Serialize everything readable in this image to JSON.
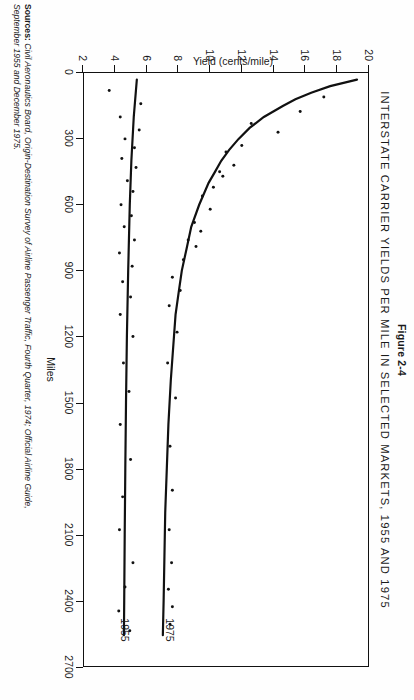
{
  "figure": {
    "number": "Figure 2-4",
    "title": "INTERSTATE CARRIER YIELDS PER MILE IN SELECTED MARKETS, 1955 AND 1975",
    "sources_label": "Sources:",
    "sources_line1": "Civil Aeronautics Board, Origin-Destination Survey of Airline Passenger Traffic, Fourth Quarter, 1974; Official Airline Guide,",
    "sources_line2": "September 1955 and December 1975."
  },
  "chart_data": {
    "type": "scatter",
    "title": "INTERSTATE CARRIER YIELDS PER MILE IN SELECTED MARKETS, 1955 AND 1975",
    "xlabel": "Miles",
    "ylabel": "Yield (cents/mile)",
    "xlim": [
      0,
      2700
    ],
    "ylim": [
      2,
      20
    ],
    "grid": false,
    "legend": "inline-curve-labels",
    "xticks": [
      0,
      300,
      600,
      900,
      1200,
      1500,
      1800,
      2100,
      2400,
      2700
    ],
    "xtick_labels": [
      "0",
      "300",
      "600",
      "900",
      "1200",
      "1500",
      "1800",
      "2100",
      "2400",
      "2700"
    ],
    "yticks": [
      2,
      4,
      6,
      8,
      10,
      12,
      14,
      16,
      18,
      20
    ],
    "ytick_labels": [
      "2",
      "4",
      "6",
      "8",
      "10",
      "12",
      "14",
      "16",
      "18",
      "20"
    ],
    "series": [
      {
        "name": "1975",
        "label": "1975",
        "label_x": 2520,
        "label_y": 7.4,
        "curve": [
          [
            30,
            19.3
          ],
          [
            60,
            17.6
          ],
          [
            90,
            16.4
          ],
          [
            120,
            15.4
          ],
          [
            150,
            14.6
          ],
          [
            200,
            13.4
          ],
          [
            250,
            12.5
          ],
          [
            300,
            11.8
          ],
          [
            350,
            11.2
          ],
          [
            400,
            10.7
          ],
          [
            450,
            10.3
          ],
          [
            500,
            9.9
          ],
          [
            600,
            9.3
          ],
          [
            700,
            8.8
          ],
          [
            800,
            8.5
          ],
          [
            900,
            8.2
          ],
          [
            1000,
            8.0
          ],
          [
            1100,
            7.8
          ],
          [
            1200,
            7.7
          ],
          [
            1400,
            7.5
          ],
          [
            1600,
            7.35
          ],
          [
            1800,
            7.25
          ],
          [
            2000,
            7.15
          ],
          [
            2200,
            7.1
          ],
          [
            2400,
            7.05
          ],
          [
            2560,
            7.0
          ]
        ],
        "points": [
          [
            110,
            17.2
          ],
          [
            175,
            15.7
          ],
          [
            230,
            12.6
          ],
          [
            270,
            14.3
          ],
          [
            330,
            12.0
          ],
          [
            360,
            11.0
          ],
          [
            420,
            11.5
          ],
          [
            450,
            10.6
          ],
          [
            470,
            10.8
          ],
          [
            520,
            10.2
          ],
          [
            560,
            9.5
          ],
          [
            620,
            10.0
          ],
          [
            680,
            9.0
          ],
          [
            720,
            9.4
          ],
          [
            760,
            8.6
          ],
          [
            790,
            9.1
          ],
          [
            850,
            8.3
          ],
          [
            930,
            7.6
          ],
          [
            990,
            8.1
          ],
          [
            1060,
            7.4
          ],
          [
            1180,
            7.9
          ],
          [
            1320,
            7.3
          ],
          [
            1480,
            7.8
          ],
          [
            1700,
            7.45
          ],
          [
            1900,
            7.6
          ],
          [
            2080,
            7.4
          ],
          [
            2230,
            7.55
          ],
          [
            2350,
            7.35
          ],
          [
            2430,
            7.6
          ],
          [
            2510,
            7.45
          ]
        ]
      },
      {
        "name": "1955",
        "label": "1955",
        "label_x": 2520,
        "label_y": 4.6,
        "curve": [
          [
            30,
            5.35
          ],
          [
            200,
            5.15
          ],
          [
            400,
            5.0
          ],
          [
            600,
            4.9
          ],
          [
            900,
            4.8
          ],
          [
            1200,
            4.72
          ],
          [
            1500,
            4.66
          ],
          [
            1800,
            4.62
          ],
          [
            2100,
            4.58
          ],
          [
            2400,
            4.55
          ],
          [
            2560,
            4.53
          ]
        ],
        "points": [
          [
            80,
            3.6
          ],
          [
            140,
            5.6
          ],
          [
            200,
            4.3
          ],
          [
            260,
            5.5
          ],
          [
            300,
            4.6
          ],
          [
            340,
            5.2
          ],
          [
            390,
            4.4
          ],
          [
            430,
            5.3
          ],
          [
            490,
            4.75
          ],
          [
            540,
            5.1
          ],
          [
            600,
            4.35
          ],
          [
            650,
            5.0
          ],
          [
            700,
            4.55
          ],
          [
            760,
            5.2
          ],
          [
            820,
            4.25
          ],
          [
            880,
            5.05
          ],
          [
            950,
            4.45
          ],
          [
            1020,
            4.95
          ],
          [
            1100,
            4.3
          ],
          [
            1200,
            5.1
          ],
          [
            1320,
            4.5
          ],
          [
            1450,
            4.85
          ],
          [
            1600,
            4.3
          ],
          [
            1760,
            4.95
          ],
          [
            1930,
            4.45
          ],
          [
            2080,
            4.25
          ],
          [
            2230,
            5.1
          ],
          [
            2340,
            4.6
          ],
          [
            2450,
            4.2
          ],
          [
            2540,
            4.9
          ]
        ]
      }
    ]
  }
}
